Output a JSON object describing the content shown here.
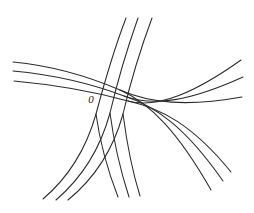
{
  "figure": {
    "kind": "curvilinear-coordinate-net",
    "background_color": "#ffffff",
    "stroke_color": "#2b2b2b",
    "stroke_width": 1.05,
    "width": 254,
    "height": 213,
    "labels": {
      "origin": {
        "text": "0",
        "x": 91,
        "y": 100,
        "font_size": 11,
        "color": "#1a1a1a"
      }
    }
  },
  "chart_data": {
    "type": "line",
    "title": "",
    "subtitle": "",
    "xlabel": "",
    "ylabel": "",
    "grid": false,
    "legend": "none",
    "xlim": [
      0,
      254
    ],
    "ylim": [
      0,
      213
    ],
    "annotations": [
      {
        "text": "0",
        "x": 91,
        "y": 100
      }
    ],
    "series": [
      {
        "name": "u-curve-1",
        "family": "u",
        "path": "M 13,62 C 55,66 92,78 120,90 C 150,103 186,107 242,97",
        "points": [
          [
            13,
            62
          ],
          [
            48,
            65
          ],
          [
            84,
            74
          ],
          [
            112,
            85
          ],
          [
            140,
            96
          ],
          [
            172,
            103
          ],
          [
            206,
            103
          ],
          [
            242,
            97
          ]
        ]
      },
      {
        "name": "u-curve-2",
        "family": "u",
        "path": "M 13,71 C 56,75 95,85 124,96 C 154,107 190,101 243,77",
        "points": [
          [
            13,
            71
          ],
          [
            48,
            74
          ],
          [
            86,
            84
          ],
          [
            116,
            94
          ],
          [
            146,
            103
          ],
          [
            180,
            99
          ],
          [
            214,
            88
          ],
          [
            243,
            77
          ]
        ]
      },
      {
        "name": "u-curve-3",
        "family": "u",
        "path": "M 14,81 C 58,85 99,93 128,101 C 158,109 196,92 241,60",
        "points": [
          [
            14,
            81
          ],
          [
            49,
            84
          ],
          [
            88,
            92
          ],
          [
            120,
            100
          ],
          [
            150,
            104
          ],
          [
            184,
            92
          ],
          [
            214,
            76
          ],
          [
            241,
            60
          ]
        ]
      },
      {
        "name": "v-curve-1",
        "family": "v",
        "path": "M 126,18 C 113,52 104,84 96,114 C 87,146 70,176 43,199",
        "points": [
          [
            126,
            18
          ],
          [
            115,
            46
          ],
          [
            106,
            78
          ],
          [
            98,
            108
          ],
          [
            89,
            138
          ],
          [
            74,
            166
          ],
          [
            58,
            185
          ],
          [
            43,
            199
          ]
        ]
      },
      {
        "name": "v-curve-2",
        "family": "v",
        "path": "M 138,18 C 126,52 117,83 110,113 C 101,146 84,176 56,200",
        "points": [
          [
            138,
            18
          ],
          [
            127,
            46
          ],
          [
            118,
            77
          ],
          [
            111,
            107
          ],
          [
            102,
            138
          ],
          [
            87,
            167
          ],
          [
            70,
            186
          ],
          [
            56,
            200
          ]
        ]
      },
      {
        "name": "v-curve-3",
        "family": "v",
        "path": "M 152,18 C 139,53 130,84 123,114 C 114,147 96,177 68,200",
        "points": [
          [
            152,
            18
          ],
          [
            140,
            47
          ],
          [
            131,
            78
          ],
          [
            124,
            108
          ],
          [
            114,
            139
          ],
          [
            99,
            168
          ],
          [
            82,
            187
          ],
          [
            68,
            200
          ]
        ]
      },
      {
        "name": "w-curve-1",
        "family": "w",
        "path": "M 96,114 C 99,136 106,166 118,197",
        "points": [
          [
            96,
            114
          ],
          [
            99,
            136
          ],
          [
            106,
            166
          ],
          [
            118,
            197
          ]
        ]
      },
      {
        "name": "w-curve-2",
        "family": "w",
        "path": "M 110,113 C 113,136 119,166 129,197",
        "points": [
          [
            110,
            113
          ],
          [
            113,
            136
          ],
          [
            119,
            166
          ],
          [
            129,
            197
          ]
        ]
      },
      {
        "name": "w-curve-3",
        "family": "w",
        "path": "M 123,114 C 126,137 131,167 140,196",
        "points": [
          [
            123,
            114
          ],
          [
            126,
            137
          ],
          [
            131,
            167
          ],
          [
            140,
            196
          ]
        ]
      },
      {
        "name": "x-curve-1",
        "family": "x",
        "path": "M 120,90 C 150,103 178,132 211,190",
        "points": [
          [
            120,
            90
          ],
          [
            150,
            103
          ],
          [
            178,
            132
          ],
          [
            211,
            190
          ]
        ]
      },
      {
        "name": "x-curve-2",
        "family": "x",
        "path": "M 124,96 C 156,106 186,128 223,181",
        "points": [
          [
            124,
            96
          ],
          [
            156,
            106
          ],
          [
            186,
            128
          ],
          [
            223,
            181
          ]
        ]
      },
      {
        "name": "x-curve-3",
        "family": "x",
        "path": "M 128,101 C 160,108 192,124 231,172",
        "points": [
          [
            128,
            101
          ],
          [
            160,
            108
          ],
          [
            192,
            124
          ],
          [
            231,
            172
          ]
        ]
      }
    ]
  }
}
